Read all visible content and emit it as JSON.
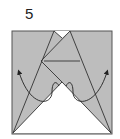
{
  "step": {
    "number": "5"
  },
  "diagram": {
    "type": "origami-fold-step",
    "paper_color": "#bdbdbd",
    "line_color": "#333333",
    "arrows": [
      {
        "name": "left-fold-arrow",
        "direction": "up-left"
      },
      {
        "name": "right-fold-arrow",
        "direction": "up-right"
      }
    ]
  }
}
